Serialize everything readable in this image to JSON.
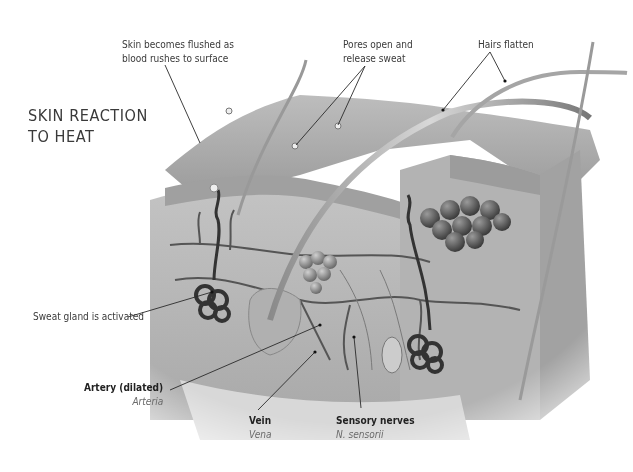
{
  "title": {
    "line1": "SKIN REACTION",
    "line2": "TO HEAT"
  },
  "labels": {
    "flushed": {
      "line1": "Skin becomes flushed as",
      "line2": "blood rushes to surface"
    },
    "pores": {
      "line1": "Pores open and",
      "line2": "release sweat"
    },
    "hairs": {
      "line1": "Hairs flatten"
    },
    "sweat_gland": {
      "line1": "Sweat gland is activated"
    },
    "artery": {
      "name": "Artery (dilated)",
      "latin": "Arteria"
    },
    "vein": {
      "name": "Vein",
      "latin": "Vena"
    },
    "nerves": {
      "name": "Sensory nerves",
      "latin": "N. sensorii"
    }
  },
  "colors": {
    "background": "#ffffff",
    "text": "#3a3a3a",
    "latin_text": "#6a6a6a",
    "leader_line": "#2a2a2a",
    "skin_surface": "#a8a8a8",
    "dermis": "#b8b8b8",
    "vessel": "#4a4a4a"
  }
}
